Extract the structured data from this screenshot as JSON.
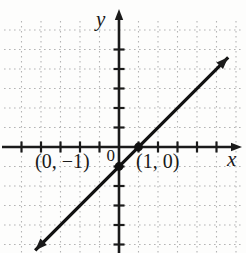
{
  "figure": {
    "y_axis_label": "y",
    "x_axis_label": "x",
    "origin_label": "0",
    "colors": {
      "axis": "#1a1a1a",
      "line": "#111111",
      "grid": "#b4b4b4",
      "text": "#191919",
      "background": "#fdfdfc"
    }
  },
  "chart_data": {
    "type": "line",
    "title": "",
    "xlabel": "x",
    "ylabel": "y",
    "x_range": [
      -5,
      6
    ],
    "y_range": [
      -5,
      6
    ],
    "grid": true,
    "tick_step": 1,
    "x_ticks": [
      -5,
      -4,
      -3,
      -2,
      -1,
      1,
      2,
      3,
      4,
      5
    ],
    "y_ticks": [
      -5,
      -4,
      -3,
      -2,
      -1,
      1,
      2,
      3,
      4,
      5
    ],
    "line": {
      "slope": 1,
      "intercept": -1,
      "equation": "y = x - 1",
      "x_extent": [
        -4.3,
        5.6
      ],
      "arrows": "both"
    },
    "points": [
      {
        "x": 0,
        "y": -1,
        "label": "(0, −1)"
      },
      {
        "x": 1,
        "y": 0,
        "label": "(1, 0)"
      }
    ]
  }
}
